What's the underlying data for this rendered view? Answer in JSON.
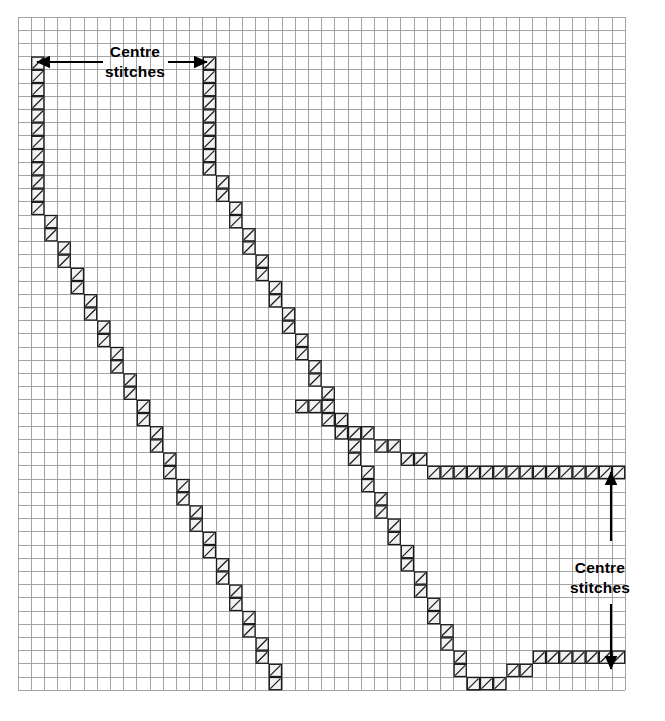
{
  "chart_data": {
    "type": "heatmap",
    "title": "",
    "grid": {
      "origin_x": 18,
      "origin_y": 17,
      "cell": 13.2,
      "cols": 46,
      "rows": 51,
      "line_color": "#9a9a9a",
      "line_width": 0.9,
      "background": "#ffffff",
      "grid_on": true
    },
    "stitch_style": {
      "fill": "#f2f2f2",
      "border": "#1a1a1a",
      "border_width": 1.3,
      "hatch": "diagonal-up",
      "hatch_color": "#1a1a1a"
    },
    "legend_position": "none",
    "xlabel": "",
    "ylabel": "",
    "cells": [
      [
        1,
        3
      ],
      [
        1,
        4
      ],
      [
        1,
        5
      ],
      [
        1,
        6
      ],
      [
        1,
        7
      ],
      [
        1,
        8
      ],
      [
        1,
        9
      ],
      [
        1,
        10
      ],
      [
        1,
        11
      ],
      [
        1,
        12
      ],
      [
        1,
        13
      ],
      [
        1,
        14
      ],
      [
        2,
        15
      ],
      [
        2,
        16
      ],
      [
        3,
        17
      ],
      [
        3,
        18
      ],
      [
        4,
        19
      ],
      [
        4,
        20
      ],
      [
        5,
        21
      ],
      [
        5,
        22
      ],
      [
        6,
        23
      ],
      [
        6,
        24
      ],
      [
        7,
        25
      ],
      [
        7,
        26
      ],
      [
        8,
        27
      ],
      [
        8,
        28
      ],
      [
        9,
        29
      ],
      [
        9,
        30
      ],
      [
        10,
        31
      ],
      [
        10,
        32
      ],
      [
        11,
        33
      ],
      [
        11,
        34
      ],
      [
        12,
        35
      ],
      [
        12,
        36
      ],
      [
        13,
        37
      ],
      [
        13,
        38
      ],
      [
        14,
        39
      ],
      [
        14,
        40
      ],
      [
        15,
        41
      ],
      [
        15,
        42
      ],
      [
        16,
        43
      ],
      [
        16,
        44
      ],
      [
        17,
        45
      ],
      [
        17,
        46
      ],
      [
        18,
        47
      ],
      [
        18,
        48
      ],
      [
        19,
        49
      ],
      [
        19,
        50
      ],
      [
        14,
        3
      ],
      [
        14,
        4
      ],
      [
        14,
        5
      ],
      [
        14,
        6
      ],
      [
        14,
        7
      ],
      [
        14,
        8
      ],
      [
        14,
        9
      ],
      [
        14,
        10
      ],
      [
        14,
        11
      ],
      [
        15,
        12
      ],
      [
        15,
        13
      ],
      [
        16,
        14
      ],
      [
        16,
        15
      ],
      [
        17,
        16
      ],
      [
        17,
        17
      ],
      [
        18,
        18
      ],
      [
        18,
        19
      ],
      [
        19,
        20
      ],
      [
        19,
        21
      ],
      [
        20,
        22
      ],
      [
        20,
        23
      ],
      [
        21,
        24
      ],
      [
        21,
        25
      ],
      [
        22,
        26
      ],
      [
        22,
        27
      ],
      [
        23,
        28
      ],
      [
        23,
        29
      ],
      [
        24,
        30
      ],
      [
        24,
        31
      ],
      [
        25,
        32
      ],
      [
        25,
        33
      ],
      [
        26,
        34
      ],
      [
        26,
        35
      ],
      [
        27,
        36
      ],
      [
        27,
        37
      ],
      [
        28,
        38
      ],
      [
        28,
        39
      ],
      [
        29,
        40
      ],
      [
        29,
        41
      ],
      [
        30,
        42
      ],
      [
        30,
        43
      ],
      [
        31,
        44
      ],
      [
        31,
        45
      ],
      [
        32,
        46
      ],
      [
        32,
        47
      ],
      [
        33,
        48
      ],
      [
        33,
        49
      ],
      [
        34,
        50
      ],
      [
        34,
        50
      ],
      [
        31,
        34
      ],
      [
        32,
        34
      ],
      [
        29,
        33
      ],
      [
        30,
        33
      ],
      [
        27,
        32
      ],
      [
        28,
        32
      ],
      [
        25,
        31
      ],
      [
        26,
        31
      ],
      [
        23,
        30
      ],
      [
        24,
        30
      ],
      [
        21,
        29
      ],
      [
        22,
        29
      ],
      [
        33,
        34
      ],
      [
        34,
        34
      ],
      [
        35,
        34
      ],
      [
        36,
        34
      ],
      [
        37,
        34
      ],
      [
        38,
        34
      ],
      [
        39,
        34
      ],
      [
        40,
        34
      ],
      [
        41,
        34
      ],
      [
        42,
        34
      ],
      [
        43,
        34
      ],
      [
        44,
        34
      ],
      [
        45,
        34
      ],
      [
        35,
        50
      ],
      [
        36,
        50
      ],
      [
        37,
        49
      ],
      [
        38,
        49
      ],
      [
        39,
        48
      ],
      [
        40,
        48
      ],
      [
        41,
        48
      ],
      [
        42,
        48
      ],
      [
        43,
        48
      ],
      [
        44,
        48
      ],
      [
        45,
        48
      ]
    ],
    "annotations": [
      {
        "id": "centre-stitches-top",
        "text_line1": "Centre",
        "text_line2": "stitches",
        "text_x": 135,
        "text_y": 57,
        "arrows": [
          {
            "from_x": 103,
            "from_y": 62,
            "to_x": 37,
            "to_y": 62
          },
          {
            "from_x": 168,
            "from_y": 62,
            "to_x": 207,
            "to_y": 62
          }
        ]
      },
      {
        "id": "centre-stitches-right",
        "text_line1": "Centre",
        "text_line2": "stitches",
        "text_x": 600,
        "text_y": 573,
        "arrows": [
          {
            "from_x": 611,
            "from_y": 541,
            "to_x": 611,
            "to_y": 472
          },
          {
            "from_x": 611,
            "from_y": 604,
            "to_x": 611,
            "to_y": 669
          }
        ]
      }
    ]
  }
}
